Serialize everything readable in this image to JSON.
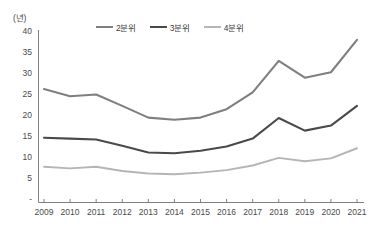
{
  "chart_data": {
    "type": "line",
    "title": "",
    "xlabel": "",
    "ylabel": "",
    "unit_label": "(년)",
    "categories": [
      "2009",
      "2010",
      "2011",
      "2012",
      "2013",
      "2014",
      "2015",
      "2016",
      "2017",
      "2018",
      "2019",
      "2020",
      "2021"
    ],
    "ylim": [
      0,
      40
    ],
    "yticks": [
      40,
      35,
      30,
      25,
      20,
      15,
      10,
      5,
      0
    ],
    "ytick_labels": [
      "40",
      "35",
      "30",
      "25",
      "20",
      "15",
      "10",
      "5",
      "-"
    ],
    "grid": false,
    "legend_position": "top-center",
    "series": [
      {
        "name": "2분위",
        "color": "#7f7f7f",
        "values": [
          26.3,
          24.6,
          25.0,
          22.3,
          19.5,
          19.0,
          19.5,
          21.5,
          25.5,
          33.0,
          29.0,
          30.3,
          38.0
        ]
      },
      {
        "name": "3분위",
        "color": "#4a4a4a",
        "values": [
          14.7,
          14.5,
          14.3,
          12.8,
          11.2,
          11.0,
          11.6,
          12.6,
          14.5,
          19.4,
          16.4,
          17.6,
          22.3
        ]
      },
      {
        "name": "4분위",
        "color": "#b5b5b5",
        "values": [
          7.8,
          7.4,
          7.8,
          6.8,
          6.2,
          6.0,
          6.4,
          7.0,
          8.1,
          9.9,
          9.1,
          9.8,
          12.2
        ]
      }
    ]
  },
  "axis": {
    "axis_color": "#808080"
  }
}
